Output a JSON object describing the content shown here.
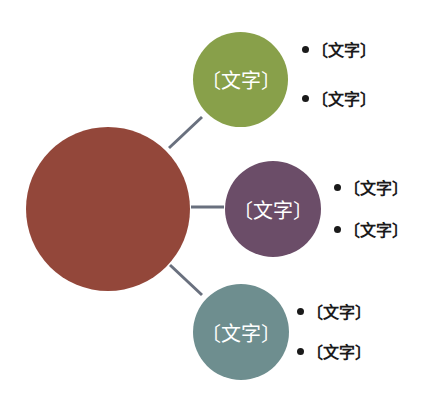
{
  "diagram": {
    "type": "hub-and-spoke",
    "hub": {
      "label": "",
      "color": "#93473a"
    },
    "connector_color": "#69707e",
    "branches": [
      {
        "label": "〔文字〕",
        "color": "#88a04a",
        "bullets": [
          "〔文字〕",
          "〔文字〕"
        ]
      },
      {
        "label": "〔文字〕",
        "color": "#6b4d68",
        "bullets": [
          "〔文字〕",
          "〔文字〕"
        ]
      },
      {
        "label": "〔文字〕",
        "color": "#6e8e8f",
        "bullets": [
          "〔文字〕",
          "〔文字〕"
        ]
      }
    ]
  }
}
